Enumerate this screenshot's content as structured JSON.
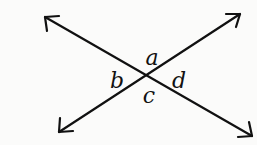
{
  "diagram": {
    "type": "intersecting-lines",
    "line_color": "#111111",
    "lines": [
      {
        "name": "line-1",
        "from": [
          45,
          17
        ],
        "to": [
          252,
          136
        ]
      },
      {
        "name": "line-2",
        "from": [
          59,
          132
        ],
        "to": [
          240,
          14
        ]
      }
    ],
    "intersection": [
      147,
      76
    ],
    "angle_labels": [
      {
        "id": "a",
        "text": "a",
        "x": 152,
        "y": 65
      },
      {
        "id": "b",
        "text": "b",
        "x": 117,
        "y": 88
      },
      {
        "id": "c",
        "text": "c",
        "x": 149,
        "y": 103
      },
      {
        "id": "d",
        "text": "d",
        "x": 179,
        "y": 88
      }
    ]
  }
}
